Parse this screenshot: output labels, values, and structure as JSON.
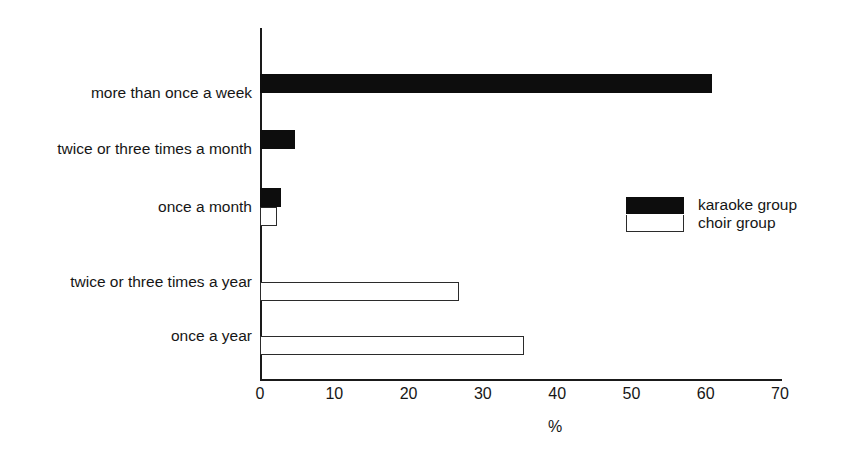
{
  "chart_data": {
    "type": "bar",
    "orientation": "horizontal",
    "title": "",
    "xlabel": "%",
    "ylabel": "",
    "xlim": [
      0,
      70
    ],
    "xticks": [
      0,
      10,
      20,
      30,
      40,
      50,
      60,
      70
    ],
    "grid": false,
    "legend_position": "center-right",
    "categories": [
      "more than once a week",
      "twice or three times a month",
      "once a month",
      "twice or three times a year",
      "once a year"
    ],
    "series": [
      {
        "name": "karaoke group",
        "color": "#0d0d0d",
        "fill": "solid-black",
        "values": [
          60.8,
          4.7,
          2.8,
          0,
          0
        ]
      },
      {
        "name": "choir group",
        "color": "#ffffff",
        "fill": "white-outlined",
        "values": [
          0,
          0,
          2.3,
          26.8,
          35.5
        ]
      }
    ]
  },
  "axis": {
    "tick_labels": [
      "0",
      "10",
      "20",
      "30",
      "40",
      "50",
      "60",
      "70"
    ],
    "x_axis_title": "%"
  },
  "legend": {
    "items": [
      {
        "label": "karaoke group"
      },
      {
        "label": "choir group"
      }
    ]
  }
}
